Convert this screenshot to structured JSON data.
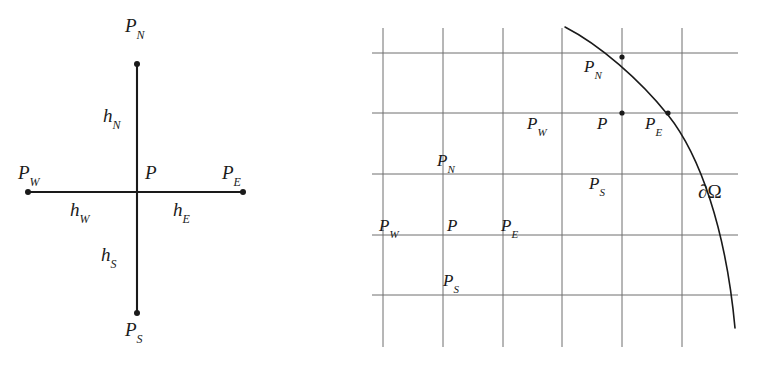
{
  "figure": {
    "background_color": "#ffffff",
    "ink_color": "#1a1a1a",
    "grid_color": "#6f6f6f",
    "width": 771,
    "height": 380
  },
  "left_panel": {
    "name": "uniform-stencil-diagram",
    "description": "Five point stencil with spacings",
    "axis": {
      "vertical": {
        "x": 137,
        "y_top": 64,
        "y_bottom": 313
      },
      "horizontal": {
        "y": 192,
        "x_left": 28,
        "x_right": 243
      }
    },
    "nodes": [
      {
        "id": "PN",
        "base": "P",
        "sub": "N",
        "dot_x": 137,
        "dot_y": 64,
        "label_x": 125,
        "label_y": 16
      },
      {
        "id": "PW",
        "base": "P",
        "sub": "W",
        "dot_x": 28,
        "dot_y": 192,
        "label_x": 18,
        "label_y": 163
      },
      {
        "id": "P",
        "base": "P",
        "sub": "",
        "dot_x": 137,
        "dot_y": 192,
        "label_x": 145,
        "label_y": 163
      },
      {
        "id": "PE",
        "base": "P",
        "sub": "E",
        "dot_x": 243,
        "dot_y": 192,
        "label_x": 222,
        "label_y": 163
      },
      {
        "id": "PS",
        "base": "P",
        "sub": "S",
        "dot_x": 137,
        "dot_y": 313,
        "label_x": 125,
        "label_y": 320
      }
    ],
    "spacings": [
      {
        "id": "hN",
        "base": "h",
        "sub": "N",
        "label_x": 103,
        "label_y": 106
      },
      {
        "id": "hW",
        "base": "h",
        "sub": "W",
        "label_x": 70,
        "label_y": 200
      },
      {
        "id": "hE",
        "base": "h",
        "sub": "E",
        "label_x": 173,
        "label_y": 200
      },
      {
        "id": "hS",
        "base": "h",
        "sub": "S",
        "label_x": 101,
        "label_y": 245
      }
    ]
  },
  "right_panel": {
    "name": "boundary-fitted-grid-diagram",
    "description": "Cartesian grid cut by a curved domain boundary",
    "grid": {
      "vertical_x": [
        383,
        443,
        503,
        562,
        622,
        682
      ],
      "vertical_y_top": 28,
      "vertical_y_bottom": 347,
      "horizontal_y": [
        53,
        113,
        174,
        235,
        295
      ],
      "horizontal_x_left": 372,
      "horizontal_x_right": 738
    },
    "boundary": {
      "id": "domega",
      "path": "M 565 27 C 600 45 640 80 668 115 C 700 155 726 230 735 328",
      "label": {
        "partial": "∂",
        "omega": "Ω",
        "x": 698,
        "y": 182
      }
    },
    "interior_cluster": [
      {
        "id": "PN",
        "base": "P",
        "sub": "N",
        "label_x": 437,
        "label_y": 152
      },
      {
        "id": "PW",
        "base": "P",
        "sub": "W",
        "label_x": 379,
        "label_y": 217
      },
      {
        "id": "P",
        "base": "P",
        "sub": "",
        "label_x": 447,
        "label_y": 217
      },
      {
        "id": "PE",
        "base": "P",
        "sub": "E",
        "label_x": 501,
        "label_y": 217
      },
      {
        "id": "PS",
        "base": "P",
        "sub": "S",
        "label_x": 443,
        "label_y": 272
      }
    ],
    "boundary_cluster": [
      {
        "id": "PN",
        "base": "P",
        "sub": "N",
        "label_x": 584,
        "label_y": 58,
        "dot_x": 622,
        "dot_y": 57
      },
      {
        "id": "PW",
        "base": "P",
        "sub": "W",
        "label_x": 527,
        "label_y": 115,
        "dot_x": null,
        "dot_y": null
      },
      {
        "id": "P",
        "base": "P",
        "sub": "",
        "label_x": 597,
        "label_y": 115,
        "dot_x": 622,
        "dot_y": 113
      },
      {
        "id": "PE",
        "base": "P",
        "sub": "E",
        "label_x": 645,
        "label_y": 115,
        "dot_x": 668,
        "dot_y": 113
      },
      {
        "id": "PS",
        "base": "P",
        "sub": "S",
        "label_x": 589,
        "label_y": 175,
        "dot_x": null,
        "dot_y": null
      }
    ]
  }
}
